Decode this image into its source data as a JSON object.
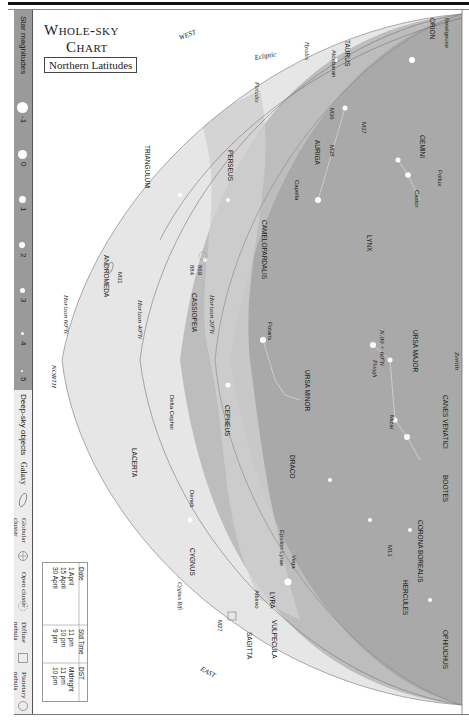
{
  "title": {
    "line1": "Whole-sky",
    "line2": "Chart",
    "subtitle": "Northern Latitudes"
  },
  "legend": {
    "star_magnitudes_label": "Star magnitudes",
    "magnitudes": [
      "-1",
      "0",
      "1",
      "2",
      "3",
      "4",
      "5"
    ],
    "deep_sky_label": "Deep-sky objects",
    "deep_sky_types": [
      {
        "label": "Galaxy",
        "icon": "ellipse-icon"
      },
      {
        "label": "Globular cluster",
        "icon": "globular-cluster-icon"
      },
      {
        "label": "Open cluster",
        "icon": "open-cluster-icon"
      },
      {
        "label": "Diffuse nebula",
        "icon": "square-icon"
      },
      {
        "label": "Planetary nebula",
        "icon": "circle-icon"
      }
    ]
  },
  "directions": {
    "west": "WEST",
    "east": "EAST",
    "north": "NORTH",
    "zenith": "Zenith",
    "zenith_lat": "40°N"
  },
  "horizons": [
    "Horizon 60°N",
    "Horizon 40°N",
    "Horizon 20°N"
  ],
  "ecliptic": "Ecliptic",
  "pole_marker": "N.09 + 60°N",
  "constellations": [
    "ORION",
    "TAURUS",
    "GEMINI",
    "AURIGA",
    "PERSEUS",
    "TRIANGULUM",
    "ANDROMEDA",
    "CASSIOPEIA",
    "CAMELOPARDALIS",
    "LYNX",
    "URSA MAJOR",
    "URSA MINOR",
    "CANES VENATICI",
    "CEPHEUS",
    "DRACO",
    "LACERTA",
    "CYGNUS",
    "BOOTES",
    "CORONA BOREALIS",
    "HERCULES",
    "LYRA",
    "VULPECULA",
    "SAGITTA",
    "OPHIUCHUS"
  ],
  "stars": [
    "Betelgeuse",
    "Aldebaran",
    "Capella",
    "Castor",
    "Pollux",
    "Polaris",
    "Mizar",
    "Delta Cephei",
    "Deneb",
    "Vega",
    "Epsilon Lyrae",
    "Albireo"
  ],
  "objects": [
    "Hyades",
    "Pleiades",
    "M36",
    "M37",
    "M38",
    "M31",
    "869",
    "884",
    "M13",
    "M27",
    "Cygnus Rift",
    "Plough"
  ],
  "time_table": {
    "headers": [
      "Date",
      "Std Time",
      "DST"
    ],
    "rows": [
      [
        "1 April",
        "11 pm",
        "Midnight"
      ],
      [
        "15 April",
        "10 pm",
        "11 pm"
      ],
      [
        "30 April",
        "9 pm",
        "10 pm"
      ]
    ]
  },
  "colors": {
    "sky_dark": "#a6a6a6",
    "sky_mid": "#c4c4c4",
    "sky_light": "#e4e4e4",
    "milky_way": "#d8d8d8",
    "legend_bg": "#9a9a9a"
  }
}
